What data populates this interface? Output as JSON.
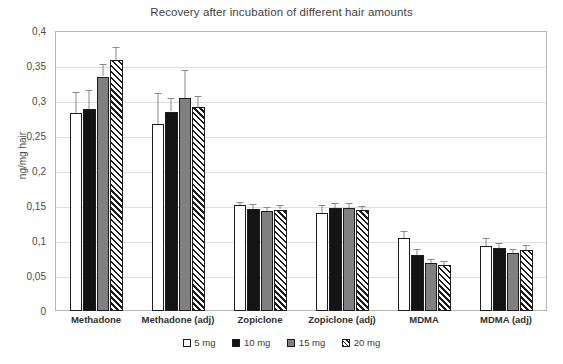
{
  "chart_data": {
    "type": "bar",
    "title": "Recovery after incubation of different hair amounts",
    "xlabel": "",
    "ylabel": "ng/mg hair",
    "ylim": [
      0,
      0.4
    ],
    "ytick_labels": [
      "0",
      "0,05",
      "0,1",
      "0,15",
      "0,2",
      "0,25",
      "0,3",
      "0,35",
      "0,4"
    ],
    "ytick_values": [
      0,
      0.05,
      0.1,
      0.15,
      0.2,
      0.25,
      0.3,
      0.35,
      0.4
    ],
    "grid": true,
    "legend_position": "bottom",
    "categories": [
      "Methadone",
      "Methadone (adj)",
      "Zopiclone",
      "Zopiclone (adj)",
      "MDMA",
      "MDMA (adj)"
    ],
    "series": [
      {
        "name": "5 mg",
        "color": "#ffffff",
        "values": [
          0.283,
          0.267,
          0.151,
          0.14,
          0.104,
          0.093
        ],
        "errors": [
          0.03,
          0.044,
          0.005,
          0.011,
          0.011,
          0.012
        ]
      },
      {
        "name": "10 mg",
        "color": "#141414",
        "values": [
          0.288,
          0.285,
          0.146,
          0.147,
          0.08,
          0.09
        ],
        "errors": [
          0.028,
          0.019,
          0.007,
          0.007,
          0.008,
          0.007
        ]
      },
      {
        "name": "15 mg",
        "color": "#808080",
        "values": [
          0.335,
          0.305,
          0.143,
          0.147,
          0.068,
          0.083
        ],
        "errors": [
          0.018,
          0.04,
          0.006,
          0.007,
          0.006,
          0.006
        ]
      },
      {
        "name": "20 mg",
        "color": "#ffffff",
        "hatch": "diagonal",
        "values": [
          0.358,
          0.291,
          0.145,
          0.144,
          0.066,
          0.087
        ],
        "errors": [
          0.019,
          0.016,
          0.006,
          0.006,
          0.006,
          0.007
        ]
      }
    ]
  }
}
